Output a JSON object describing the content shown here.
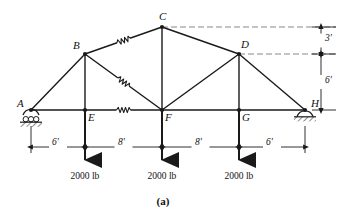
{
  "figure": {
    "caption": "(a)",
    "type": "truss-free-body-diagram"
  },
  "joints": [
    {
      "id": "A",
      "label": "A",
      "x": 31,
      "y": 110,
      "label_dx": -14,
      "label_dy": -12,
      "support": "roller"
    },
    {
      "id": "B",
      "label": "B",
      "x": 85,
      "y": 54,
      "label_dx": -12,
      "label_dy": -14,
      "support": "none"
    },
    {
      "id": "C",
      "label": "C",
      "x": 162,
      "y": 27,
      "label_dx": -3,
      "label_dy": -16,
      "support": "none"
    },
    {
      "id": "D",
      "label": "D",
      "x": 239,
      "y": 54,
      "label_dx": 2,
      "label_dy": -15,
      "support": "none"
    },
    {
      "id": "E",
      "label": "E",
      "x": 85,
      "y": 110,
      "label_dx": 3,
      "label_dy": 2,
      "support": "none"
    },
    {
      "id": "F",
      "label": "F",
      "x": 162,
      "y": 110,
      "label_dx": 3,
      "label_dy": 2,
      "support": "none"
    },
    {
      "id": "G",
      "label": "G",
      "x": 239,
      "y": 110,
      "label_dx": 3,
      "label_dy": 2,
      "support": "none"
    },
    {
      "id": "H",
      "label": "H",
      "x": 305,
      "y": 110,
      "label_dx": 6,
      "label_dy": -12,
      "support": "pin"
    }
  ],
  "members": [
    {
      "from": "A",
      "to": "B",
      "marked": false
    },
    {
      "from": "B",
      "to": "C",
      "marked": true
    },
    {
      "from": "C",
      "to": "D",
      "marked": false
    },
    {
      "from": "D",
      "to": "H",
      "marked": false
    },
    {
      "from": "A",
      "to": "E",
      "marked": false
    },
    {
      "from": "E",
      "to": "F",
      "marked": true
    },
    {
      "from": "F",
      "to": "G",
      "marked": false
    },
    {
      "from": "G",
      "to": "H",
      "marked": false
    },
    {
      "from": "B",
      "to": "E",
      "marked": false
    },
    {
      "from": "B",
      "to": "F",
      "marked": true
    },
    {
      "from": "C",
      "to": "F",
      "marked": false
    },
    {
      "from": "D",
      "to": "F",
      "marked": false
    },
    {
      "from": "D",
      "to": "G",
      "marked": false
    }
  ],
  "loads": [
    {
      "at": "E",
      "x": 85,
      "label": "2000 lb",
      "arrow_top": 110,
      "arrow_bottom": 168,
      "label_y": 172
    },
    {
      "at": "F",
      "x": 162,
      "label": "2000 lb",
      "arrow_top": 110,
      "arrow_bottom": 168,
      "label_y": 172
    },
    {
      "at": "G",
      "x": 239,
      "label": "2000 lb",
      "arrow_top": 110,
      "arrow_bottom": 168,
      "label_y": 172
    }
  ],
  "horizontal_dimensions": [
    {
      "label": "6'",
      "x1": 31,
      "x2": 85,
      "y": 147,
      "label_x": 52,
      "label_y": 138
    },
    {
      "label": "8'",
      "x1": 85,
      "x2": 162,
      "y": 147,
      "label_x": 118,
      "label_y": 138
    },
    {
      "label": "8'",
      "x1": 162,
      "x2": 239,
      "y": 147,
      "label_x": 195,
      "label_y": 138
    },
    {
      "label": "6'",
      "x1": 239,
      "x2": 305,
      "y": 147,
      "label_x": 266,
      "label_y": 138
    }
  ],
  "vertical_dimensions": [
    {
      "label": "3'",
      "x": 321,
      "y1": 27,
      "y2": 54,
      "label_x": 325,
      "label_y": 34
    },
    {
      "label": "6'",
      "x": 321,
      "y1": 54,
      "y2": 110,
      "label_x": 325,
      "label_y": 76
    }
  ],
  "extension_lines": [
    {
      "x1": 162,
      "y1": 27,
      "x2": 336,
      "y2": 27
    },
    {
      "x1": 239,
      "y1": 54,
      "x2": 336,
      "y2": 54
    }
  ],
  "witness_lines": [
    {
      "x": 31,
      "y1": 126,
      "y2": 153
    },
    {
      "x": 305,
      "y1": 126,
      "y2": 153
    }
  ],
  "caption_pos": {
    "x": 163,
    "y": 196
  },
  "colors": {
    "line": "#1a1a1a",
    "dash": "#6b6b6b",
    "text": "#111111",
    "background": "#ffffff"
  },
  "dimension_units": "feet",
  "load_units": "pounds"
}
